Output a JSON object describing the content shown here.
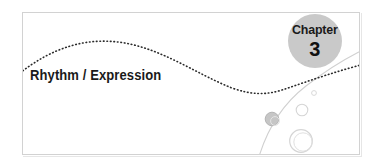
{
  "banner": {
    "title": "Rhythm / Expression",
    "badge": {
      "label": "Chapter",
      "number": "3"
    },
    "colors": {
      "badge_fill": "#c9c9c9",
      "text": "#1a1a1a",
      "frame_border": "#d2d2d2",
      "dotted_curve": "#2b2b2b",
      "thin_curve": "#cfcfcf",
      "bubble_stroke": "#d8d8d8",
      "bubble_fill_gray": "#c4c4c4",
      "background": "#ffffff"
    },
    "decor": {
      "dotted_wave_label": "dotted-wave-curve",
      "thin_arc_label": "thin-sweep-curve",
      "bubbles": [
        {
          "name": "bubble-gray-filled",
          "cx": 272,
          "cy": 119,
          "r": 7
        },
        {
          "name": "bubble-small-ring",
          "cx": 302,
          "cy": 110,
          "r": 6
        },
        {
          "name": "bubble-tiny-dot",
          "cx": 314,
          "cy": 93,
          "r": 2.5
        },
        {
          "name": "bubble-large-ring",
          "cx": 301,
          "cy": 141,
          "r": 11.5
        }
      ]
    }
  }
}
